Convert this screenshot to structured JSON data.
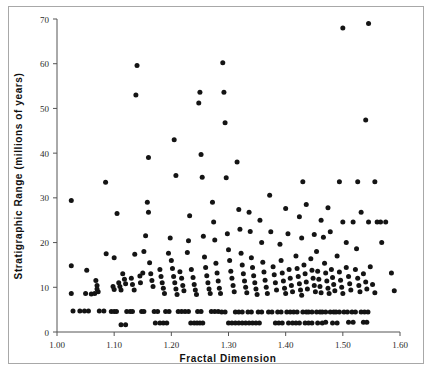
{
  "chart_data": {
    "type": "scatter",
    "title": "",
    "xlabel": "Fractal Dimension",
    "ylabel": "Stratigraphic Range (millions of years)",
    "xlim": [
      1.0,
      1.6
    ],
    "ylim": [
      0,
      70
    ],
    "xticks": [
      1.0,
      1.1,
      1.2,
      1.3,
      1.4,
      1.5,
      1.6
    ],
    "xtick_labels": [
      "1.00",
      "1.10",
      "1.20",
      "1.30",
      "1.40",
      "1.50",
      "1.60"
    ],
    "yticks": [
      0,
      10,
      20,
      30,
      40,
      50,
      60,
      70
    ],
    "ytick_labels": [
      "0",
      "10",
      "20",
      "30",
      "40",
      "50",
      "60",
      "70"
    ],
    "grid": false,
    "legend": null,
    "marker": "filled-circle",
    "marker_color": "#141414",
    "marker_size_px": 5,
    "points": [
      [
        1.025,
        29.4
      ],
      [
        1.025,
        14.8
      ],
      [
        1.025,
        8.6
      ],
      [
        1.028,
        4.7
      ],
      [
        1.04,
        4.7
      ],
      [
        1.048,
        4.7
      ],
      [
        1.055,
        4.7
      ],
      [
        1.052,
        13.8
      ],
      [
        1.05,
        8.6
      ],
      [
        1.06,
        8.5
      ],
      [
        1.066,
        8.6
      ],
      [
        1.068,
        11.5
      ],
      [
        1.07,
        10.4
      ],
      [
        1.07,
        9.6
      ],
      [
        1.072,
        9.0
      ],
      [
        1.074,
        4.7
      ],
      [
        1.082,
        4.7
      ],
      [
        1.085,
        33.5
      ],
      [
        1.086,
        17.5
      ],
      [
        1.095,
        4.6
      ],
      [
        1.1,
        4.6
      ],
      [
        1.104,
        4.6
      ],
      [
        1.1,
        16.6
      ],
      [
        1.098,
        10.2
      ],
      [
        1.1,
        9.5
      ],
      [
        1.105,
        26.5
      ],
      [
        1.108,
        11.0
      ],
      [
        1.11,
        10.2
      ],
      [
        1.112,
        9.4
      ],
      [
        1.112,
        1.6
      ],
      [
        1.12,
        1.6
      ],
      [
        1.115,
        13.0
      ],
      [
        1.118,
        11.8
      ],
      [
        1.12,
        10.8
      ],
      [
        1.122,
        4.6
      ],
      [
        1.128,
        4.6
      ],
      [
        1.132,
        4.6
      ],
      [
        1.13,
        12.0
      ],
      [
        1.132,
        10.6
      ],
      [
        1.135,
        9.4
      ],
      [
        1.136,
        17.4
      ],
      [
        1.138,
        53.0
      ],
      [
        1.14,
        59.6
      ],
      [
        1.145,
        12.5
      ],
      [
        1.146,
        11.0
      ],
      [
        1.148,
        4.6
      ],
      [
        1.152,
        4.6
      ],
      [
        1.15,
        13.2
      ],
      [
        1.152,
        18.0
      ],
      [
        1.155,
        21.5
      ],
      [
        1.158,
        29.0
      ],
      [
        1.16,
        26.8
      ],
      [
        1.16,
        39.0
      ],
      [
        1.162,
        15.5
      ],
      [
        1.164,
        13.0
      ],
      [
        1.166,
        11.5
      ],
      [
        1.168,
        10.2
      ],
      [
        1.17,
        4.6
      ],
      [
        1.176,
        4.6
      ],
      [
        1.172,
        2.0
      ],
      [
        1.18,
        2.0
      ],
      [
        1.186,
        2.0
      ],
      [
        1.192,
        2.0
      ],
      [
        1.18,
        14.0
      ],
      [
        1.182,
        12.4
      ],
      [
        1.184,
        11.0
      ],
      [
        1.186,
        9.8
      ],
      [
        1.188,
        8.6
      ],
      [
        1.19,
        4.6
      ],
      [
        1.196,
        4.6
      ],
      [
        1.195,
        17.6
      ],
      [
        1.198,
        21.0
      ],
      [
        1.2,
        16.0
      ],
      [
        1.202,
        14.2
      ],
      [
        1.204,
        12.4
      ],
      [
        1.206,
        11.0
      ],
      [
        1.208,
        9.6
      ],
      [
        1.21,
        8.4
      ],
      [
        1.212,
        4.6
      ],
      [
        1.218,
        4.6
      ],
      [
        1.205,
        43.0
      ],
      [
        1.208,
        35.0
      ],
      [
        1.215,
        13.5
      ],
      [
        1.218,
        12.0
      ],
      [
        1.22,
        10.4
      ],
      [
        1.222,
        9.2
      ],
      [
        1.224,
        4.6
      ],
      [
        1.23,
        4.6
      ],
      [
        1.234,
        2.0
      ],
      [
        1.24,
        2.0
      ],
      [
        1.245,
        2.0
      ],
      [
        1.25,
        2.0
      ],
      [
        1.255,
        2.0
      ],
      [
        1.228,
        17.8
      ],
      [
        1.23,
        20.4
      ],
      [
        1.232,
        26.0
      ],
      [
        1.235,
        14.0
      ],
      [
        1.238,
        12.2
      ],
      [
        1.24,
        10.6
      ],
      [
        1.242,
        9.4
      ],
      [
        1.244,
        8.4
      ],
      [
        1.246,
        4.6
      ],
      [
        1.252,
        4.6
      ],
      [
        1.248,
        51.2
      ],
      [
        1.25,
        53.6
      ],
      [
        1.252,
        39.7
      ],
      [
        1.254,
        34.6
      ],
      [
        1.256,
        21.4
      ],
      [
        1.258,
        16.8
      ],
      [
        1.26,
        14.4
      ],
      [
        1.262,
        12.6
      ],
      [
        1.264,
        11.0
      ],
      [
        1.266,
        9.6
      ],
      [
        1.268,
        8.6
      ],
      [
        1.27,
        4.6
      ],
      [
        1.276,
        4.6
      ],
      [
        1.282,
        4.6
      ],
      [
        1.272,
        29.0
      ],
      [
        1.274,
        24.6
      ],
      [
        1.276,
        20.6
      ],
      [
        1.278,
        15.4
      ],
      [
        1.28,
        13.2
      ],
      [
        1.282,
        11.4
      ],
      [
        1.284,
        9.8
      ],
      [
        1.286,
        8.6
      ],
      [
        1.288,
        4.5
      ],
      [
        1.294,
        4.5
      ],
      [
        1.29,
        60.2
      ],
      [
        1.292,
        53.6
      ],
      [
        1.294,
        46.8
      ],
      [
        1.296,
        34.5
      ],
      [
        1.298,
        22.0
      ],
      [
        1.3,
        18.4
      ],
      [
        1.302,
        16.0
      ],
      [
        1.304,
        13.6
      ],
      [
        1.306,
        12.0
      ],
      [
        1.308,
        10.4
      ],
      [
        1.31,
        9.0
      ],
      [
        1.312,
        4.5
      ],
      [
        1.318,
        4.5
      ],
      [
        1.324,
        4.5
      ],
      [
        1.3,
        2.0
      ],
      [
        1.306,
        2.0
      ],
      [
        1.312,
        2.0
      ],
      [
        1.318,
        2.0
      ],
      [
        1.324,
        2.0
      ],
      [
        1.33,
        2.0
      ],
      [
        1.315,
        38.0
      ],
      [
        1.318,
        27.4
      ],
      [
        1.32,
        23.0
      ],
      [
        1.322,
        17.6
      ],
      [
        1.324,
        15.0
      ],
      [
        1.326,
        13.0
      ],
      [
        1.328,
        11.4
      ],
      [
        1.33,
        10.0
      ],
      [
        1.332,
        8.8
      ],
      [
        1.334,
        4.5
      ],
      [
        1.34,
        4.5
      ],
      [
        1.336,
        26.8
      ],
      [
        1.338,
        22.5
      ],
      [
        1.34,
        16.6
      ],
      [
        1.342,
        14.4
      ],
      [
        1.344,
        12.6
      ],
      [
        1.346,
        11.0
      ],
      [
        1.348,
        9.6
      ],
      [
        1.35,
        8.4
      ],
      [
        1.352,
        4.5
      ],
      [
        1.358,
        4.5
      ],
      [
        1.336,
        2.0
      ],
      [
        1.342,
        2.0
      ],
      [
        1.348,
        2.0
      ],
      [
        1.354,
        2.0
      ],
      [
        1.355,
        25.0
      ],
      [
        1.358,
        20.0
      ],
      [
        1.36,
        15.6
      ],
      [
        1.362,
        13.4
      ],
      [
        1.364,
        11.6
      ],
      [
        1.366,
        10.0
      ],
      [
        1.368,
        8.6
      ],
      [
        1.37,
        4.5
      ],
      [
        1.376,
        4.5
      ],
      [
        1.372,
        30.6
      ],
      [
        1.374,
        22.4
      ],
      [
        1.378,
        14.6
      ],
      [
        1.38,
        12.8
      ],
      [
        1.382,
        11.0
      ],
      [
        1.384,
        9.4
      ],
      [
        1.386,
        4.5
      ],
      [
        1.392,
        4.5
      ],
      [
        1.382,
        2.0
      ],
      [
        1.388,
        2.0
      ],
      [
        1.394,
        2.0
      ],
      [
        1.39,
        19.6
      ],
      [
        1.392,
        16.0
      ],
      [
        1.394,
        13.2
      ],
      [
        1.396,
        11.4
      ],
      [
        1.398,
        9.8
      ],
      [
        1.4,
        8.6
      ],
      [
        1.402,
        4.5
      ],
      [
        1.408,
        4.5
      ],
      [
        1.4,
        27.6
      ],
      [
        1.404,
        22.0
      ],
      [
        1.406,
        14.0
      ],
      [
        1.408,
        12.0
      ],
      [
        1.41,
        10.4
      ],
      [
        1.412,
        9.0
      ],
      [
        1.414,
        4.5
      ],
      [
        1.42,
        4.5
      ],
      [
        1.405,
        2.0
      ],
      [
        1.412,
        2.0
      ],
      [
        1.418,
        2.0
      ],
      [
        1.424,
        2.0
      ],
      [
        1.418,
        17.0
      ],
      [
        1.42,
        14.2
      ],
      [
        1.422,
        12.4
      ],
      [
        1.424,
        10.8
      ],
      [
        1.426,
        9.4
      ],
      [
        1.428,
        8.2
      ],
      [
        1.43,
        4.5
      ],
      [
        1.436,
        4.5
      ],
      [
        1.424,
        25.8
      ],
      [
        1.428,
        21.0
      ],
      [
        1.432,
        15.0
      ],
      [
        1.434,
        13.0
      ],
      [
        1.436,
        11.2
      ],
      [
        1.438,
        9.6
      ],
      [
        1.44,
        4.5
      ],
      [
        1.446,
        4.5
      ],
      [
        1.434,
        2.0
      ],
      [
        1.44,
        2.0
      ],
      [
        1.446,
        2.0
      ],
      [
        1.43,
        33.6
      ],
      [
        1.436,
        28.5
      ],
      [
        1.444,
        16.4
      ],
      [
        1.446,
        13.8
      ],
      [
        1.448,
        12.0
      ],
      [
        1.45,
        10.4
      ],
      [
        1.452,
        9.0
      ],
      [
        1.454,
        4.5
      ],
      [
        1.46,
        4.5
      ],
      [
        1.45,
        21.8
      ],
      [
        1.454,
        18.0
      ],
      [
        1.456,
        13.6
      ],
      [
        1.458,
        11.8
      ],
      [
        1.46,
        10.2
      ],
      [
        1.462,
        8.8
      ],
      [
        1.464,
        4.5
      ],
      [
        1.47,
        4.5
      ],
      [
        1.456,
        2.0
      ],
      [
        1.464,
        2.0
      ],
      [
        1.47,
        2.2
      ],
      [
        1.462,
        25.0
      ],
      [
        1.466,
        21.2
      ],
      [
        1.468,
        15.4
      ],
      [
        1.47,
        13.2
      ],
      [
        1.472,
        11.4
      ],
      [
        1.474,
        9.8
      ],
      [
        1.476,
        8.6
      ],
      [
        1.478,
        4.5
      ],
      [
        1.484,
        4.5
      ],
      [
        1.474,
        27.8
      ],
      [
        1.478,
        22.4
      ],
      [
        1.48,
        14.0
      ],
      [
        1.482,
        12.2
      ],
      [
        1.484,
        10.6
      ],
      [
        1.486,
        9.2
      ],
      [
        1.488,
        4.5
      ],
      [
        1.494,
        4.5
      ],
      [
        1.482,
        2.0
      ],
      [
        1.49,
        2.0
      ],
      [
        1.49,
        17.0
      ],
      [
        1.494,
        13.4
      ],
      [
        1.496,
        11.6
      ],
      [
        1.498,
        10.0
      ],
      [
        1.5,
        8.6
      ],
      [
        1.502,
        4.5
      ],
      [
        1.508,
        4.5
      ],
      [
        1.494,
        33.6
      ],
      [
        1.5,
        24.6
      ],
      [
        1.506,
        20.0
      ],
      [
        1.506,
        14.4
      ],
      [
        1.51,
        12.4
      ],
      [
        1.512,
        10.8
      ],
      [
        1.514,
        9.4
      ],
      [
        1.516,
        4.5
      ],
      [
        1.522,
        4.5
      ],
      [
        1.51,
        2.2
      ],
      [
        1.518,
        2.2
      ],
      [
        1.518,
        24.6
      ],
      [
        1.524,
        18.6
      ],
      [
        1.522,
        14.0
      ],
      [
        1.526,
        12.0
      ],
      [
        1.528,
        10.4
      ],
      [
        1.53,
        9.0
      ],
      [
        1.532,
        4.5
      ],
      [
        1.538,
        4.5
      ],
      [
        1.526,
        33.6
      ],
      [
        1.532,
        26.8
      ],
      [
        1.536,
        13.0
      ],
      [
        1.54,
        11.2
      ],
      [
        1.542,
        9.6
      ],
      [
        1.544,
        4.5
      ],
      [
        1.536,
        2.2
      ],
      [
        1.542,
        2.2
      ],
      [
        1.54,
        47.4
      ],
      [
        1.545,
        24.6
      ],
      [
        1.548,
        14.6
      ],
      [
        1.552,
        10.6
      ],
      [
        1.556,
        8.8
      ],
      [
        1.5,
        68.0
      ],
      [
        1.545,
        69.0
      ],
      [
        1.56,
        24.6
      ],
      [
        1.566,
        24.6
      ],
      [
        1.575,
        24.6
      ],
      [
        1.556,
        33.6
      ],
      [
        1.568,
        20.0
      ],
      [
        1.585,
        13.2
      ],
      [
        1.59,
        9.2
      ]
    ]
  },
  "axes": {
    "x_title": "Fractal Dimension",
    "y_title": "Stratigraphic Range (millions of years)"
  }
}
